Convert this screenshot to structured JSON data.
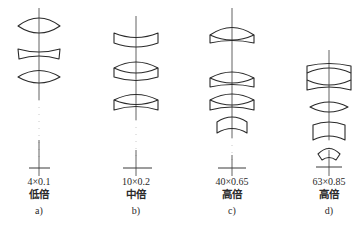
{
  "figure": {
    "panels": [
      {
        "id": "a",
        "spec": "4×0.1",
        "magnification": "低倍",
        "tag": "a)",
        "axis_x": 39,
        "lenses": [
          "biconvex",
          "biconcave",
          "biconvex"
        ]
      },
      {
        "id": "b",
        "spec": "10×0.2",
        "magnification": "中倍",
        "tag": "b)",
        "axis_x": 136,
        "lenses": [
          "meniscus-concave-top",
          "cemented-doublet",
          "cemented-doublet"
        ]
      },
      {
        "id": "c",
        "spec": "40×0.65",
        "magnification": "高倍",
        "tag": "c)",
        "axis_x": 232,
        "lenses": [
          "cemented-doublet",
          "cemented-doublet",
          "cemented-doublet",
          "meniscus-concave-top"
        ]
      },
      {
        "id": "d",
        "spec": "63×0.85",
        "magnification": "高倍",
        "tag": "d)",
        "axis_x": 329,
        "lenses": [
          "cemented-triplet",
          "biconvex",
          "meniscus-concave-top",
          "meniscus-small"
        ]
      }
    ]
  }
}
